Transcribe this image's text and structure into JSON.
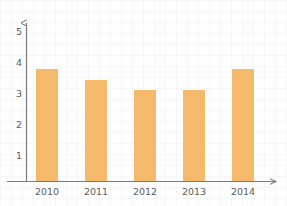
{
  "chart_data": {
    "type": "bar",
    "title": "",
    "subtitle": "",
    "xlabel": "",
    "ylabel": "",
    "categories": [
      "2010",
      "2011",
      "2012",
      "2013",
      "2014"
    ],
    "values": [
      3.6,
      3.25,
      2.95,
      2.95,
      3.6
    ],
    "series": [
      {
        "name": "",
        "values": [
          3.6,
          3.25,
          2.95,
          2.95,
          3.6
        ]
      }
    ],
    "ylim": [
      0,
      5.4
    ],
    "xlim": [
      0,
      5
    ],
    "y_ticks": [
      "1",
      "2",
      "3",
      "4",
      "5"
    ],
    "y_tick_values": [
      1,
      2,
      3,
      4,
      5
    ],
    "x_ticks": [
      "2010",
      "2011",
      "2012",
      "2013",
      "2014"
    ],
    "grid": false,
    "legend": null,
    "legend_position": "none",
    "annotations": [],
    "bar_color": "#f5b96c",
    "axis_color": "#7a7a7a",
    "tick_label_color": "#5d5d5d",
    "background_color": "#ffffff",
    "axis_arrows": true
  },
  "axes": {
    "y_axis_name": "value-axis",
    "x_axis_name": "year-axis"
  }
}
